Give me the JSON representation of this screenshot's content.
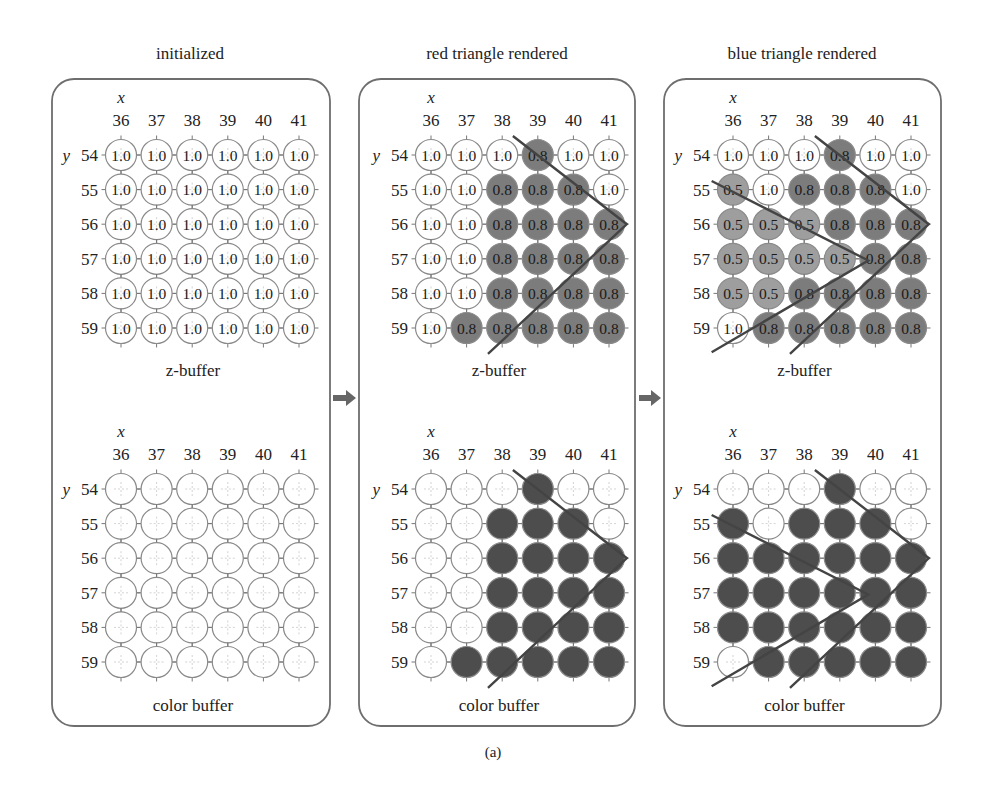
{
  "figure": {
    "caption": "(a)",
    "colors": {
      "panel_border": "#6e6e6e",
      "circle_stroke": "#8a8a8a",
      "empty_fill": "#ffffff",
      "depth_08_fill": "#7c7c7c",
      "depth_05_fill": "#9e9e9e",
      "color_red_fill": "#4d4d4d",
      "color_blue_fill": "#4d4d4d",
      "triangle_line": "#444444",
      "arrow": "#666666"
    },
    "x_axis_label": "x",
    "y_axis_label": "y",
    "x_values": [
      "36",
      "37",
      "38",
      "39",
      "40",
      "41"
    ],
    "y_values": [
      "54",
      "55",
      "56",
      "57",
      "58",
      "59"
    ],
    "panels": [
      {
        "title": "initialized",
        "zbuffer_label": "z-buffer",
        "colorbuffer_label": "color buffer",
        "zbuffer": [
          [
            "1.0",
            "1.0",
            "1.0",
            "1.0",
            "1.0",
            "1.0"
          ],
          [
            "1.0",
            "1.0",
            "1.0",
            "1.0",
            "1.0",
            "1.0"
          ],
          [
            "1.0",
            "1.0",
            "1.0",
            "1.0",
            "1.0",
            "1.0"
          ],
          [
            "1.0",
            "1.0",
            "1.0",
            "1.0",
            "1.0",
            "1.0"
          ],
          [
            "1.0",
            "1.0",
            "1.0",
            "1.0",
            "1.0",
            "1.0"
          ],
          [
            "1.0",
            "1.0",
            "1.0",
            "1.0",
            "1.0",
            "1.0"
          ]
        ],
        "colorbuffer": [
          [
            "bg",
            "bg",
            "bg",
            "bg",
            "bg",
            "bg"
          ],
          [
            "bg",
            "bg",
            "bg",
            "bg",
            "bg",
            "bg"
          ],
          [
            "bg",
            "bg",
            "bg",
            "bg",
            "bg",
            "bg"
          ],
          [
            "bg",
            "bg",
            "bg",
            "bg",
            "bg",
            "bg"
          ],
          [
            "bg",
            "bg",
            "bg",
            "bg",
            "bg",
            "bg"
          ],
          [
            "bg",
            "bg",
            "bg",
            "bg",
            "bg",
            "bg"
          ]
        ],
        "triangles": []
      },
      {
        "title": "red triangle rendered",
        "zbuffer_label": "z-buffer",
        "colorbuffer_label": "color buffer",
        "zbuffer": [
          [
            "1.0",
            "1.0",
            "1.0",
            "0.8",
            "1.0",
            "1.0"
          ],
          [
            "1.0",
            "1.0",
            "0.8",
            "0.8",
            "0.8",
            "1.0"
          ],
          [
            "1.0",
            "1.0",
            "0.8",
            "0.8",
            "0.8",
            "0.8"
          ],
          [
            "1.0",
            "1.0",
            "0.8",
            "0.8",
            "0.8",
            "0.8"
          ],
          [
            "1.0",
            "1.0",
            "0.8",
            "0.8",
            "0.8",
            "0.8"
          ],
          [
            "1.0",
            "0.8",
            "0.8",
            "0.8",
            "0.8",
            "0.8"
          ]
        ],
        "colorbuffer": [
          [
            "bg",
            "bg",
            "bg",
            "red",
            "bg",
            "bg"
          ],
          [
            "bg",
            "bg",
            "red",
            "red",
            "red",
            "bg"
          ],
          [
            "bg",
            "bg",
            "red",
            "red",
            "red",
            "red"
          ],
          [
            "bg",
            "bg",
            "red",
            "red",
            "red",
            "red"
          ],
          [
            "bg",
            "bg",
            "red",
            "red",
            "red",
            "red"
          ],
          [
            "bg",
            "red",
            "red",
            "red",
            "red",
            "red"
          ]
        ],
        "triangles": [
          {
            "name": "red",
            "points": [
              [
                38.3,
                53.45
              ],
              [
                41.5,
                56.0
              ],
              [
                37.6,
                59.75
              ]
            ]
          }
        ]
      },
      {
        "title": "blue triangle rendered",
        "zbuffer_label": "z-buffer",
        "colorbuffer_label": "color buffer",
        "zbuffer": [
          [
            "1.0",
            "1.0",
            "1.0",
            "0.8",
            "1.0",
            "1.0"
          ],
          [
            "0.5",
            "1.0",
            "0.8",
            "0.8",
            "0.8",
            "1.0"
          ],
          [
            "0.5",
            "0.5",
            "0.5",
            "0.8",
            "0.8",
            "0.8"
          ],
          [
            "0.5",
            "0.5",
            "0.5",
            "0.5",
            "0.8",
            "0.8"
          ],
          [
            "0.5",
            "0.5",
            "0.8",
            "0.8",
            "0.8",
            "0.8"
          ],
          [
            "1.0",
            "0.8",
            "0.8",
            "0.8",
            "0.8",
            "0.8"
          ]
        ],
        "colorbuffer": [
          [
            "bg",
            "bg",
            "bg",
            "red",
            "bg",
            "bg"
          ],
          [
            "blue",
            "bg",
            "red",
            "red",
            "red",
            "bg"
          ],
          [
            "blue",
            "blue",
            "blue",
            "red",
            "red",
            "red"
          ],
          [
            "blue",
            "blue",
            "blue",
            "blue",
            "red",
            "red"
          ],
          [
            "blue",
            "blue",
            "red",
            "red",
            "red",
            "red"
          ],
          [
            "bg",
            "red",
            "red",
            "red",
            "red",
            "red"
          ]
        ],
        "triangles": [
          {
            "name": "red",
            "points": [
              [
                38.3,
                53.45
              ],
              [
                41.5,
                56.0
              ],
              [
                37.6,
                59.75
              ]
            ]
          },
          {
            "name": "blue",
            "points": [
              [
                35.4,
                54.75
              ],
              [
                39.8,
                57.05
              ],
              [
                35.4,
                59.7
              ]
            ]
          }
        ]
      }
    ]
  }
}
